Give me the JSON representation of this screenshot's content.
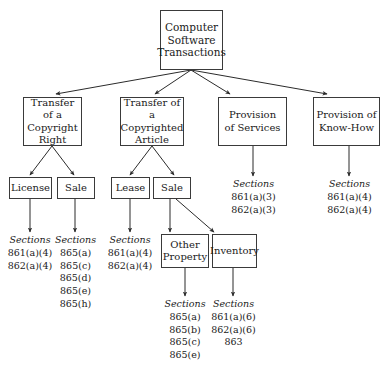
{
  "diagram": {
    "title": "Computer Software Transactions",
    "root": {
      "label": "Computer\nSoftware\nTransactions"
    },
    "level2": [
      {
        "label": "Transfer of a\nCopyright\nRight"
      },
      {
        "label": "Transfer of a\nCopyrighted\nArticle"
      },
      {
        "label": "Provision\nof Services"
      },
      {
        "label": "Provision of\nKnow-How"
      }
    ],
    "level3": [
      {
        "label": "License"
      },
      {
        "label": "Sale"
      },
      {
        "label": "Lease"
      },
      {
        "label": "Sale"
      }
    ],
    "level4": [
      {
        "label": "Other\nProperty"
      },
      {
        "label": "Inventory"
      }
    ],
    "sections": {
      "license": {
        "title": "Sections",
        "items": [
          "861(a)(4)",
          "862(a)(4)"
        ]
      },
      "copyright_sale": {
        "title": "Sections",
        "items": [
          "865(a)",
          "865(c)",
          "865(d)",
          "865(e)",
          "865(h)"
        ]
      },
      "lease": {
        "title": "Sections",
        "items": [
          "861(a)(4)",
          "862(a)(4)"
        ]
      },
      "services": {
        "title": "Sections",
        "items": [
          "861(a)(3)",
          "862(a)(3)"
        ]
      },
      "know_how": {
        "title": "Sections",
        "items": [
          "861(a)(4)",
          "862(a)(4)"
        ]
      },
      "other_property": {
        "title": "Sections",
        "items": [
          "865(a)",
          "865(b)",
          "865(c)",
          "865(e)"
        ]
      },
      "inventory": {
        "title": "Sections",
        "items": [
          "861(a)(6)",
          "862(a)(6)",
          "863"
        ]
      }
    },
    "colors": {
      "box_border": "#3a3a3a",
      "edge": "#2b2b2b",
      "text": "#1a1a1a",
      "background": "#ffffff"
    }
  }
}
